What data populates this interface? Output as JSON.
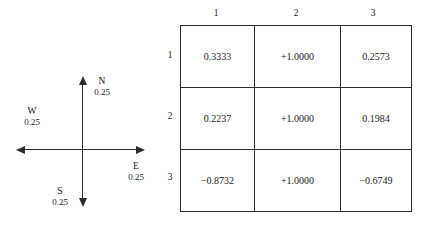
{
  "figure": {
    "background_color": "#ffffff",
    "ink_color": "#2b2b2b"
  },
  "compass": {
    "name": "direction-weights-compass",
    "directions": [
      {
        "id": "north",
        "name": "N",
        "value": "0.25"
      },
      {
        "id": "east",
        "name": "E",
        "value": "0.25"
      },
      {
        "id": "south",
        "name": "S",
        "value": "0.25"
      },
      {
        "id": "west",
        "name": "W",
        "value": "0.25"
      }
    ]
  },
  "matrix": {
    "name": "coefficient-matrix",
    "column_headers": [
      "1",
      "2",
      "3"
    ],
    "row_headers": [
      "1",
      "2",
      "3"
    ],
    "rows": [
      [
        "0.3333",
        "+1.0000",
        "0.2573"
      ],
      [
        "0.2237",
        "+1.0000",
        "0.1984"
      ],
      [
        "−0.8732",
        "+1.0000",
        "−0.6749"
      ]
    ]
  },
  "chart_data": {
    "type": "table",
    "title": "",
    "xlabel": "",
    "ylabel": "",
    "column_headers": [
      "1",
      "2",
      "3"
    ],
    "row_headers": [
      "1",
      "2",
      "3"
    ],
    "values": [
      [
        0.3333,
        1.0,
        0.2573
      ],
      [
        0.2237,
        1.0,
        0.1984
      ],
      [
        -0.8732,
        1.0,
        -0.6749
      ]
    ],
    "cell_text": [
      [
        "0.3333",
        "+1.0000",
        "0.2573"
      ],
      [
        "0.2237",
        "+1.0000",
        "0.1984"
      ],
      [
        "−0.8732",
        "+1.0000",
        "−0.6749"
      ]
    ],
    "annotations": {
      "compass_labels": [
        "N 0.25",
        "E 0.25",
        "S 0.25",
        "W 0.25"
      ],
      "compass_values": [
        0.25,
        0.25,
        0.25,
        0.25
      ]
    },
    "grid": true,
    "legend": "none"
  }
}
